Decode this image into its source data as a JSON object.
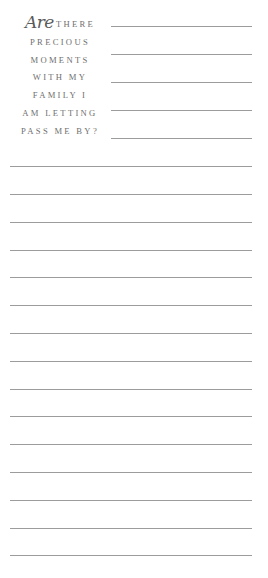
{
  "prompt": {
    "script_word": "Are",
    "rows": [
      "THERE",
      "PRECIOUS",
      "MOMENTS",
      "WITH MY",
      "FAMILY I",
      "AM LETTING",
      "PASS ME BY?"
    ]
  },
  "lines": {
    "short_count": 5,
    "full_count": 15,
    "color": "#9c9c9c"
  }
}
